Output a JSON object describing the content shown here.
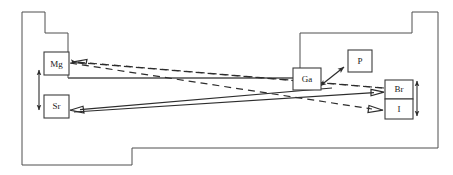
{
  "figure": {
    "type": "schematic-floorplan-diagram",
    "background_color": "#ffffff",
    "outline_color": "#4f4f4f",
    "box_stroke_color": "#3c3c3c",
    "arrow_color": "#2d2d2d",
    "label_color": "#1a1a1a",
    "width": 453,
    "height": 175
  },
  "margin_text": {
    "left_fragment": ""
  },
  "nodes": [
    {
      "id": "mg",
      "label": "Mg",
      "x": 44,
      "y": 52,
      "w": 25,
      "h": 23
    },
    {
      "id": "sr",
      "label": "Sr",
      "x": 44,
      "y": 95,
      "w": 25,
      "h": 23
    },
    {
      "id": "ga",
      "label": "Ga",
      "x": 293,
      "y": 68,
      "w": 28,
      "h": 22
    },
    {
      "id": "p",
      "label": "P",
      "x": 348,
      "y": 50,
      "w": 24,
      "h": 22
    },
    {
      "id": "br",
      "label": "Br",
      "x": 385,
      "y": 80,
      "w": 28,
      "h": 19
    },
    {
      "id": "i",
      "label": "I",
      "x": 385,
      "y": 99,
      "w": 28,
      "h": 20
    }
  ],
  "connections": [
    {
      "id": "br-to-mg",
      "style": "dashed",
      "from": "br-region",
      "to": "mg",
      "arrowheads": "end",
      "points": "384,88 72,62"
    },
    {
      "id": "mg-region-to-i",
      "style": "dashed",
      "from": "mg-region",
      "to": "i",
      "arrowheads": "end",
      "points": "70,63 382,110"
    },
    {
      "id": "ga-to-sr",
      "style": "solid",
      "from": "ga-region",
      "to": "sr",
      "arrowheads": "end",
      "points": "330,88 72,110"
    },
    {
      "id": "sr-region-to-br",
      "style": "solid",
      "from": "sr-region",
      "to": "br",
      "arrowheads": "end",
      "points": "74,112 382,92"
    },
    {
      "id": "ga-to-p",
      "style": "solid-double",
      "from": "ga",
      "to": "p",
      "arrowheads": "both",
      "points": "318,87 346,66"
    }
  ],
  "scale_indicators": [
    {
      "id": "left-vertical-extent",
      "orientation": "vertical",
      "arrowheads": "both",
      "x": 39,
      "y1": 68,
      "y2": 112
    },
    {
      "id": "right-vertical-extent",
      "orientation": "vertical",
      "arrowheads": "both",
      "x": 417,
      "y1": 79,
      "y2": 118
    }
  ],
  "outline": {
    "description": "stepped enclosure outline",
    "path": "M 22 12 L 45 12 L 45 33 L 68 33 L 68 78 L 300 78 L 300 33 L 412 33 L 412 12 L 438 12 L 438 148 L 132 148 L 132 165 L 22 165 Z"
  },
  "inner_lines": [
    {
      "id": "left-shelf-line",
      "x1": 68,
      "y1": 78,
      "x2": 300,
      "y2": 78
    }
  ]
}
